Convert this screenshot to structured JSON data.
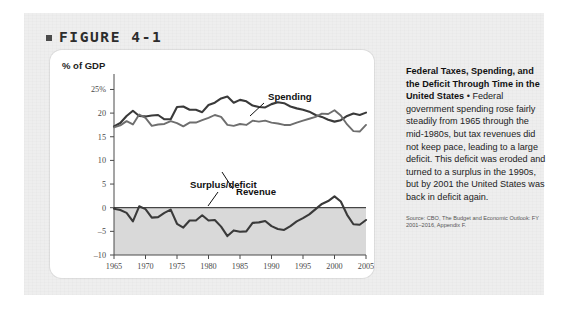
{
  "figure": {
    "bullet": "■",
    "label": "FIGURE 4-1"
  },
  "chart_axis": {
    "y_axis_title": "% of GDP",
    "y_ticks": [
      "25%",
      "20",
      "15",
      "10",
      "5",
      "0",
      "–5",
      "–10"
    ],
    "x_ticks": [
      "1965",
      "1970",
      "1975",
      "1980",
      "1985",
      "1990",
      "1995",
      "2000",
      "2005"
    ]
  },
  "annotations": {
    "spending": "Spending",
    "revenue": "Revenue",
    "surplus_deficit": "Surplus/deficit"
  },
  "caption": {
    "heading": "Federal Taxes, Spending, and the Deficit Through Time in the United States",
    "separator": " • ",
    "text": "Federal government spending rose fairly steadily from 1965 through the mid-1980s, but tax revenues did not keep pace, leading to a large deficit. This deficit was eroded and turned to a surplus in the 1990s, but by 2001 the United States was back in deficit again.",
    "source": "Source: CBO, The Budget and Economic Outlook: FY 2001–2016, Appendix F."
  },
  "colors": {
    "panel_background": "#eeeeee",
    "card_background": "#ffffff",
    "spending_line": "#3a3a3a",
    "revenue_line": "#6e6e6e",
    "deficit_line": "#3a3a3a",
    "deficit_fill": "#d9d9d9",
    "axis": "#4a4a4a",
    "text": "#222222"
  },
  "chart_data": {
    "type": "line",
    "title": "Federal Taxes, Spending, and the Deficit Through Time in the United States",
    "xlabel": "",
    "ylabel": "% of GDP",
    "xlim": [
      1965,
      2005
    ],
    "ylim": [
      -10,
      27
    ],
    "grid": false,
    "legend": "inline-annotations",
    "x": [
      1965,
      1966,
      1967,
      1968,
      1969,
      1970,
      1971,
      1972,
      1973,
      1974,
      1975,
      1976,
      1977,
      1978,
      1979,
      1980,
      1981,
      1982,
      1983,
      1984,
      1985,
      1986,
      1987,
      1988,
      1989,
      1990,
      1991,
      1992,
      1993,
      1994,
      1995,
      1996,
      1997,
      1998,
      1999,
      2000,
      2001,
      2002,
      2003,
      2004,
      2005
    ],
    "series": [
      {
        "name": "Spending",
        "color": "#3a3a3a",
        "values": [
          17.2,
          17.9,
          19.4,
          20.5,
          19.4,
          19.3,
          19.5,
          19.6,
          18.7,
          18.7,
          21.3,
          21.4,
          20.7,
          20.7,
          20.2,
          21.7,
          22.2,
          23.1,
          23.5,
          22.2,
          22.8,
          22.5,
          21.6,
          21.3,
          21.2,
          21.9,
          22.3,
          22.1,
          21.4,
          21.0,
          20.7,
          20.3,
          19.6,
          19.2,
          18.6,
          18.2,
          18.5,
          19.4,
          19.9,
          19.6,
          20.1
        ]
      },
      {
        "name": "Revenue",
        "color": "#6e6e6e",
        "values": [
          17.0,
          17.4,
          18.3,
          17.6,
          19.7,
          19.0,
          17.3,
          17.6,
          17.7,
          18.3,
          17.9,
          17.2,
          18.0,
          18.0,
          18.5,
          19.0,
          19.6,
          19.2,
          17.5,
          17.3,
          17.7,
          17.5,
          18.4,
          18.2,
          18.4,
          18.0,
          17.8,
          17.5,
          17.5,
          18.0,
          18.4,
          18.8,
          19.2,
          19.9,
          19.8,
          20.6,
          19.5,
          17.6,
          16.2,
          16.1,
          17.5
        ]
      },
      {
        "name": "Surplus/deficit",
        "color": "#3a3a3a",
        "values": [
          -0.2,
          -0.5,
          -1.1,
          -2.9,
          0.3,
          -0.3,
          -2.1,
          -2.0,
          -1.1,
          -0.4,
          -3.4,
          -4.2,
          -2.7,
          -2.7,
          -1.6,
          -2.7,
          -2.6,
          -4.0,
          -6.0,
          -4.8,
          -5.1,
          -5.0,
          -3.2,
          -3.1,
          -2.8,
          -3.9,
          -4.5,
          -4.7,
          -3.9,
          -2.9,
          -2.2,
          -1.4,
          -0.3,
          0.8,
          1.4,
          2.4,
          1.3,
          -1.5,
          -3.5,
          -3.6,
          -2.6
        ]
      }
    ]
  }
}
